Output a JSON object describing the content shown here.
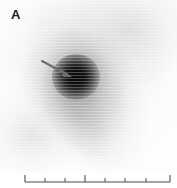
{
  "panel": {
    "label": "A",
    "modality": "planar scintigraphy grayscale scan",
    "orientation_note": ""
  },
  "scan": {
    "background_color": "#ffffff",
    "hot_spot": {
      "name": "focal-uptake-hot-spot",
      "center_x": 76,
      "center_y": 77,
      "radius": 24,
      "core_color": "#0a0a0a"
    },
    "diffuse_activity": {
      "description": "diagonal band of moderate uptake running from lower-left to upper-right",
      "color": "#787878"
    },
    "marker_arrow": {
      "name": "pointer-arrow",
      "color": "#6e6e6e",
      "tail_x": 41,
      "tail_y": 61,
      "tip_x": 72,
      "tip_y": 76
    }
  },
  "scale_bar": {
    "name": "ruler-scale-bar",
    "color": "#4a4a4a",
    "axis_y": 10,
    "start_x": 25,
    "end_x": 170,
    "ticks": [
      {
        "x": 25,
        "height": 7,
        "major": true
      },
      {
        "x": 45,
        "height": 4,
        "major": false
      },
      {
        "x": 65,
        "height": 4,
        "major": false
      },
      {
        "x": 85,
        "height": 7,
        "major": true
      },
      {
        "x": 105,
        "height": 4,
        "major": false
      },
      {
        "x": 125,
        "height": 4,
        "major": false
      },
      {
        "x": 146,
        "height": 4,
        "major": false
      },
      {
        "x": 170,
        "height": 7,
        "major": true
      }
    ]
  },
  "colors": {
    "ink": "#1b1b1b",
    "arrow": "#6e6e6e",
    "ruler": "#4a4a4a",
    "page": "#ffffff"
  }
}
